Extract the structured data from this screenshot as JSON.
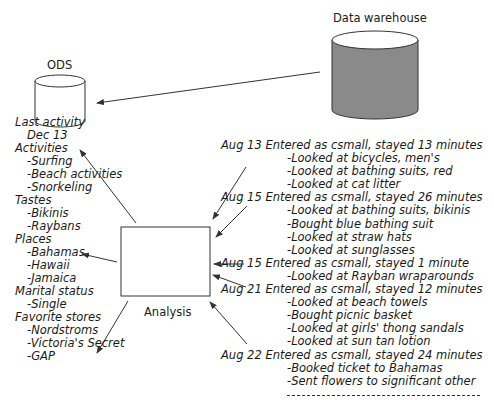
{
  "diagram": {
    "ods_label": "ODS",
    "warehouse_label": "Data warehouse",
    "analysis_label": "Analysis",
    "colors": {
      "warehouse_fill": "#8a8a8a",
      "line": "#333333"
    }
  },
  "profile": {
    "last_activity": {
      "heading": "Last activity",
      "value": "Dec 13"
    },
    "activities": {
      "heading": "Activities",
      "items": [
        "-Surfing",
        "-Beach activities",
        "-Snorkeling"
      ]
    },
    "tastes": {
      "heading": "Tastes",
      "items": [
        "-Bikinis",
        "-Raybans"
      ]
    },
    "places": {
      "heading": "Places",
      "items": [
        "-Bahamas",
        "-Hawaii",
        "-Jamaica"
      ]
    },
    "marital_status": {
      "heading": "Marital status",
      "items": [
        "-Single"
      ]
    },
    "favorite_stores": {
      "heading": "Favorite stores",
      "items": [
        "-Nordstroms",
        "-Victoria's Secret",
        "-GAP"
      ]
    }
  },
  "sessions": [
    {
      "header": "Aug 13 Entered as csmall, stayed 13 minutes",
      "items": [
        "-Looked at bicycles, men's",
        "-Looked at bathing suits, red",
        "-Looked at cat litter"
      ]
    },
    {
      "header": "Aug 15 Entered as csmall, stayed 26 minutes",
      "items": [
        "-Looked at bathing suits, bikinis",
        "-Bought blue bathing suit",
        "-Looked at straw hats",
        "-Looked at sunglasses"
      ]
    },
    {
      "header": "Aug 15 Entered as csmall, stayed 1 minute",
      "items": [
        "-Looked at Rayban wraparounds"
      ]
    },
    {
      "header": "Aug 21 Entered as csmall, stayed 12 minutes",
      "items": [
        "-Looked at beach towels",
        "-Bought picnic basket",
        "-Looked at girls' thong sandals",
        "-Looked at sun tan lotion"
      ]
    },
    {
      "header": "Aug 22 Entered as csmall, stayed 24 minutes",
      "items": [
        "-Booked ticket to Bahamas",
        "-Sent flowers to significant other"
      ]
    }
  ]
}
